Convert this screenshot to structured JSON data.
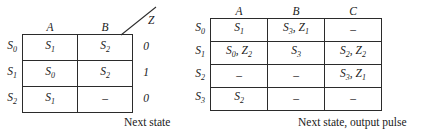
{
  "figure": {
    "kind": "state-transition-tables",
    "ink_color": "#1a1a1a",
    "rule_color": "#2b2b2b"
  },
  "left_table": {
    "name": "next-state-table",
    "caption": "Next state",
    "corner": "",
    "column_headers": [
      "A",
      "B"
    ],
    "output_header": "Z",
    "row_headers": [
      "S_0",
      "S_1",
      "S_2"
    ],
    "rows": [
      {
        "label": "S_0",
        "cells": [
          "S_1",
          "S_2"
        ],
        "output": "0"
      },
      {
        "label": "S_1",
        "cells": [
          "S_0",
          "S_2"
        ],
        "output": "1"
      },
      {
        "label": "S_2",
        "cells": [
          "S_1",
          "–"
        ],
        "output": "0"
      }
    ]
  },
  "right_table": {
    "name": "next-state-output-pulse-table",
    "caption": "Next state, output pulse",
    "corner": "",
    "column_headers": [
      "A",
      "B",
      "C"
    ],
    "row_headers": [
      "S_0",
      "S_1",
      "S_2",
      "S_3"
    ],
    "rows": [
      {
        "label": "S_0",
        "cells": [
          "S_1",
          "S_3, Z_1",
          "–"
        ]
      },
      {
        "label": "S_1",
        "cells": [
          "S_0, Z_2",
          "S_3",
          "S_2, Z_2"
        ]
      },
      {
        "label": "S_2",
        "cells": [
          "–",
          "–",
          "S_3, Z_1"
        ]
      },
      {
        "label": "S_3",
        "cells": [
          "S_2",
          "–",
          "–"
        ]
      }
    ]
  }
}
